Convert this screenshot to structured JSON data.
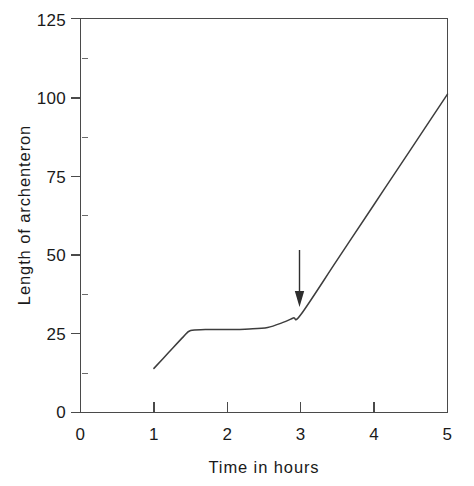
{
  "chart_data": {
    "type": "line",
    "title": "",
    "xlabel": "Time in hours",
    "ylabel": "Length of archenteron",
    "xlim": [
      0,
      5
    ],
    "ylim": [
      0,
      125
    ],
    "grid": false,
    "legend": null,
    "x_ticks": [
      "0",
      "1",
      "2",
      "3",
      "4",
      "5"
    ],
    "x_tick_values": [
      0,
      1,
      2,
      3,
      4,
      5
    ],
    "y_ticks": [
      "0",
      "25",
      "50",
      "75",
      "100",
      "125"
    ],
    "y_tick_values": [
      0,
      25,
      50,
      75,
      100,
      125
    ],
    "y_minor_tick_values": [
      12.5,
      37.5,
      62.5,
      87.5,
      112.5
    ],
    "series": [
      {
        "name": "Length of archenteron",
        "x": [
          1.0,
          1.2,
          1.4,
          1.5,
          1.7,
          2.0,
          2.3,
          2.55,
          2.75,
          2.9,
          3.0,
          3.5,
          4.0,
          4.5,
          5.0
        ],
        "values": [
          14,
          19,
          24,
          26,
          26.3,
          26.3,
          26.5,
          27,
          28.5,
          30,
          31,
          48.5,
          66,
          83.5,
          101
        ]
      }
    ],
    "annotations": [
      {
        "type": "arrow",
        "label": "",
        "points_to_x": 3.0,
        "points_to_y": 34,
        "tail_y": 51
      }
    ]
  },
  "figure": {
    "background_color": "#ffffff",
    "axis_color": "#4a4a4a",
    "curve_color": "#3d3d3d",
    "text_color": "#1a1a1a"
  }
}
